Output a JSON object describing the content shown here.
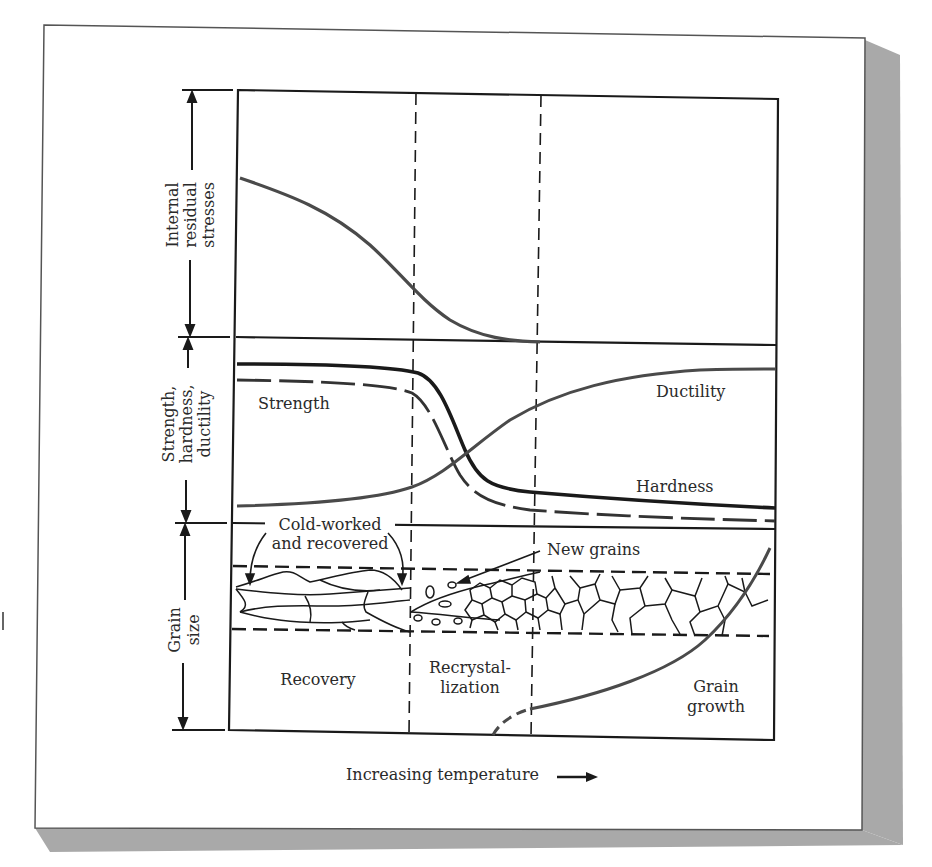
{
  "figure": {
    "side_labels": {
      "internal_residual_stresses": [
        "Internal",
        "residual",
        "stresses"
      ],
      "strength_hardness_ductility": [
        "Strength,",
        "hardness,",
        "ductility"
      ],
      "grain_size": [
        "Grain",
        "size"
      ]
    },
    "curve_labels": {
      "strength": "Strength",
      "ductility": "Ductility",
      "hardness": "Hardness"
    },
    "annotations": {
      "cold_worked_line1": "Cold-worked",
      "cold_worked_line2": "and recovered",
      "new_grains": "New grains"
    },
    "regions": {
      "recovery": "Recovery",
      "recrystallization_line1": "Recrystal-",
      "recrystallization_line2": "lization",
      "grain_growth_line1": "Grain",
      "grain_growth_line2": "growth"
    },
    "x_axis": {
      "label": "Increasing temperature",
      "arrow": "right-arrow"
    },
    "colors": {
      "line": "#1a1a1a",
      "curve": "#4a4a4a",
      "shadow": "#a8a8a8",
      "background": "#ffffff"
    }
  }
}
